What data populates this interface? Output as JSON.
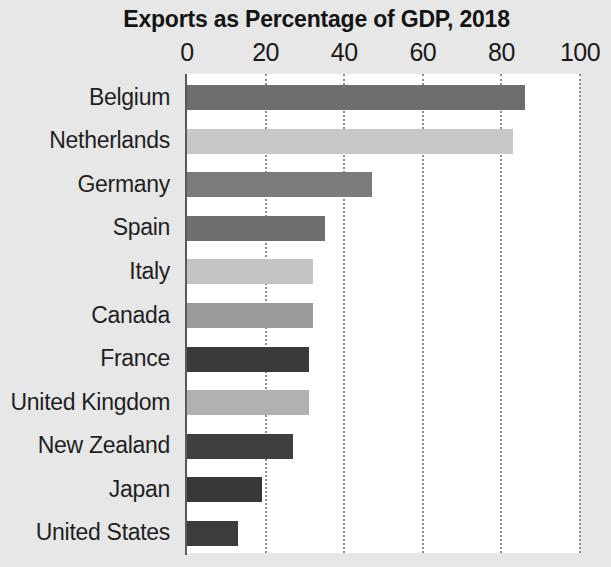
{
  "chart_data": {
    "type": "bar",
    "orientation": "horizontal",
    "title": "Exports as Percentage of GDP, 2018",
    "xlabel": "",
    "ylabel": "",
    "xlim": [
      0,
      100
    ],
    "xticks": [
      0,
      20,
      40,
      60,
      80,
      100
    ],
    "xtick_labels": [
      "0",
      "20",
      "40",
      "60",
      "80",
      "100"
    ],
    "grid": "vertical-dotted",
    "legend": "none",
    "categories": [
      "Belgium",
      "Netherlands",
      "Germany",
      "Spain",
      "Italy",
      "Canada",
      "France",
      "United Kingdom",
      "New Zealand",
      "Japan",
      "United States"
    ],
    "values": [
      86,
      83,
      47,
      35,
      32,
      32,
      31,
      31,
      27,
      19,
      13
    ],
    "bar_colors": [
      "#6e6e6e",
      "#c8c8c8",
      "#7b7b7b",
      "#6f6f6f",
      "#c4c4c4",
      "#9b9b9b",
      "#3a3a3a",
      "#b1b1b1",
      "#3f3f3f",
      "#383838",
      "#3c3c3c"
    ]
  },
  "colors": {
    "background": "#e7e7e7",
    "plot_background": "#ffffff",
    "axis": "#5a5a5a",
    "gridline": "#8d8d8d",
    "text": "#1a1a1a"
  }
}
